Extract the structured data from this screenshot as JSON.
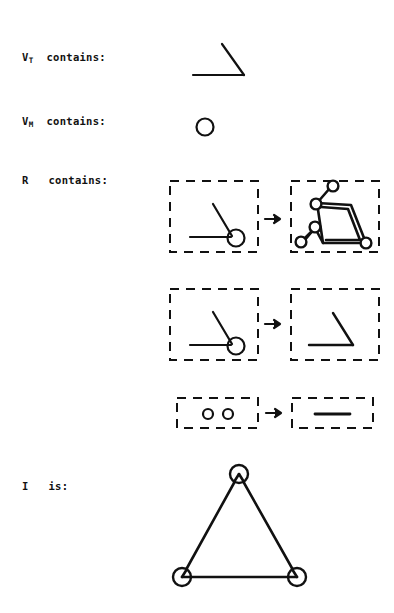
{
  "figure": {
    "title_present": false,
    "background_color": "#ffffff",
    "ink_color": "#111111",
    "width": 394,
    "height": 613,
    "labels": {
      "vt": {
        "symbol": "V",
        "subscript": "T",
        "text": "contains:",
        "full": "V_T contains:"
      },
      "vm": {
        "symbol": "V",
        "subscript": "M",
        "text": "contains:",
        "full": "V_M contains:"
      },
      "r": {
        "symbol": "R",
        "subscript": "",
        "text": "contains:",
        "full": "R contains:"
      },
      "i": {
        "symbol": "I",
        "subscript": "",
        "text": "is:",
        "full": "I is:"
      }
    },
    "operators": {
      "arrow": "right-arrow",
      "arrow_glyph": "→"
    },
    "vt_shapes": [
      {
        "name": "open-angle",
        "description": "bent line: horizontal segment meeting a diagonal segment at a right-hand vertex"
      }
    ],
    "vm_shapes": [
      {
        "name": "circle-node",
        "description": "small open circle"
      }
    ],
    "rules": [
      {
        "index": 1,
        "lhs": {
          "name": "angle-with-node",
          "description": "open angle with a circle node at the vertex",
          "boxed": true
        },
        "operator": "→",
        "rhs": {
          "name": "triangle-with-antennae",
          "description": "triangle with circle nodes at corners plus two antenna segments ending in circle nodes",
          "boxed": true
        }
      },
      {
        "index": 2,
        "lhs": {
          "name": "angle-with-node",
          "description": "open angle with a circle node at the vertex",
          "boxed": true
        },
        "operator": "→",
        "rhs": {
          "name": "open-angle",
          "description": "plain open angle, node removed",
          "boxed": true
        }
      },
      {
        "index": 3,
        "lhs": {
          "name": "two-nodes",
          "description": "two small circle nodes side by side",
          "boxed": true
        },
        "operator": "→",
        "rhs": {
          "name": "edge-segment",
          "description": "single horizontal line segment",
          "boxed": true
        }
      }
    ],
    "axiom": {
      "name": "triangle-with-three-nodes",
      "description": "equilateral-ish triangle with circle nodes at each of the three vertices"
    }
  }
}
